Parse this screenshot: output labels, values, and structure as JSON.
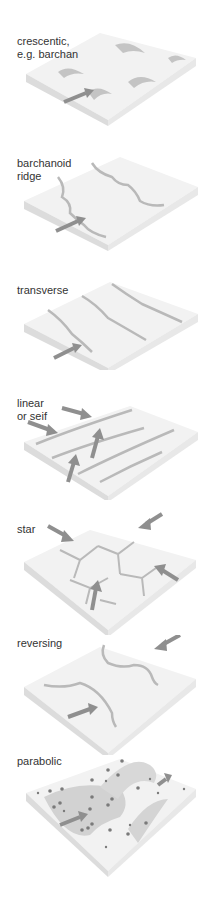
{
  "figure": {
    "colors": {
      "top": "#f2f2f2",
      "left_side": "#dcdcdc",
      "right_side": "#e8e8e8",
      "ridge_shadow": "#b9b9b9",
      "arrow": "#8f8f8f",
      "text": "#333333",
      "pebble": "#7a7a7a"
    },
    "panels": [
      {
        "id": "crescentic",
        "label": "crescentic,\ne.g. barchan",
        "top": 0
      },
      {
        "id": "barchanoid",
        "label": "barchanoid\nridge",
        "top": 127
      },
      {
        "id": "transverse",
        "label": "transverse",
        "top": 252
      },
      {
        "id": "linear",
        "label": "linear\nor seif",
        "top": 370
      },
      {
        "id": "star",
        "label": "star",
        "top": 500
      },
      {
        "id": "reversing",
        "label": "reversing",
        "top": 635
      },
      {
        "id": "parabolic",
        "label": "parabolic",
        "top": 755
      }
    ]
  }
}
